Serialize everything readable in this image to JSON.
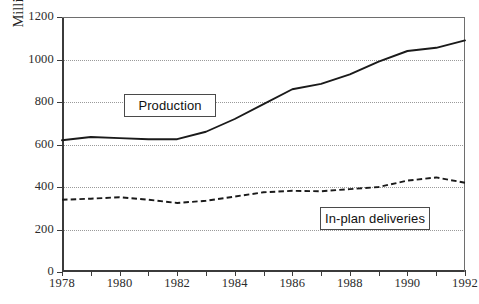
{
  "chart_data": {
    "type": "line",
    "title": "",
    "xlabel": "",
    "ylabel": "Million Metric Tons",
    "xlim": [
      1978,
      1992
    ],
    "ylim": [
      0,
      1200
    ],
    "ytick_labels": [
      "0",
      "200",
      "400",
      "600",
      "800",
      "1000",
      "1200"
    ],
    "ytick_values": [
      0,
      200,
      400,
      600,
      800,
      1000,
      1200
    ],
    "xtick_values": [
      1978,
      1979,
      1980,
      1981,
      1982,
      1983,
      1984,
      1985,
      1986,
      1987,
      1988,
      1989,
      1990,
      1991,
      1992
    ],
    "xtick_labels": [
      "1978",
      "",
      "1980",
      "",
      "1982",
      "",
      "1984",
      "",
      "1986",
      "",
      "1988",
      "",
      "1990",
      "",
      "1992"
    ],
    "grid": "horizontal-dotted",
    "legend_position": "inline-annotations",
    "x": [
      1978,
      1979,
      1980,
      1981,
      1982,
      1983,
      1984,
      1985,
      1986,
      1987,
      1988,
      1989,
      1990,
      1991,
      1992
    ],
    "series": [
      {
        "name": "Production",
        "style": "solid",
        "values": [
          620,
          635,
          630,
          625,
          625,
          660,
          720,
          790,
          860,
          885,
          930,
          990,
          1040,
          1055,
          1090
        ]
      },
      {
        "name": "In-plan deliveries",
        "style": "dashed",
        "values": [
          340,
          345,
          352,
          340,
          325,
          335,
          355,
          375,
          382,
          380,
          390,
          400,
          430,
          445,
          420
        ]
      }
    ],
    "annotations": [
      {
        "text": "Production",
        "x": 1981.1,
        "y": 800
      },
      {
        "text": "In-plan deliveries",
        "x": 1988.7,
        "y": 270
      }
    ]
  },
  "caption": {
    "fragment": ""
  }
}
